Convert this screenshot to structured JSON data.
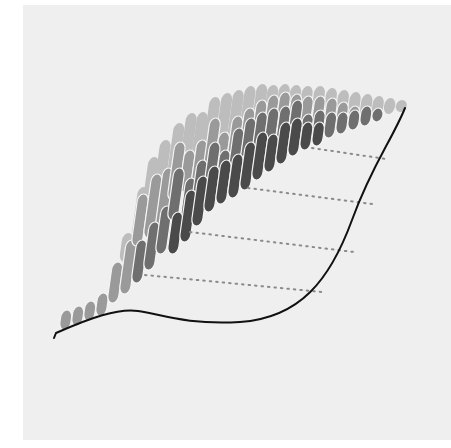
{
  "figure": {
    "background": "#efefef",
    "page_background": "#ffffff",
    "panel": {
      "x": 23,
      "y": 5,
      "w": 428,
      "h": 435
    },
    "outline_color": "#111111",
    "vein_color": "#8a8a8a",
    "layer_colors": [
      "#bdbdbd",
      "#9a9a9a",
      "#6f6f6f",
      "#4a4a4a"
    ],
    "separator_color": "#f4f4f4"
  },
  "leaf": {
    "outline_path": "M54,338 L56,333 C90,318 118,308 138,311 C160,314 185,325 240,322 C300,318 330,280 352,220 C372,165 392,140 405,108",
    "stem_tip": {
      "x": 54,
      "y": 338
    }
  },
  "veins": [
    {
      "x1": 312,
      "y1": 148,
      "x2": 386,
      "y2": 159
    },
    {
      "x1": 248,
      "y1": 188,
      "x2": 372,
      "y2": 204
    },
    {
      "x1": 190,
      "y1": 232,
      "x2": 354,
      "y2": 252
    },
    {
      "x1": 145,
      "y1": 275,
      "x2": 322,
      "y2": 292
    }
  ],
  "chart_data": {
    "type": "bar",
    "title": "",
    "xlabel": "",
    "ylabel": "",
    "legend": [],
    "layers": [
      "layer-1-light",
      "layer-2",
      "layer-3",
      "layer-4-dark"
    ],
    "columns": [
      {
        "x": 59,
        "w": 11,
        "segments": [
          {
            "l": 1,
            "top": 310,
            "bot": 330
          }
        ]
      },
      {
        "x": 71,
        "w": 11,
        "segments": [
          {
            "l": 1,
            "top": 306,
            "bot": 326
          }
        ]
      },
      {
        "x": 83,
        "w": 11,
        "segments": [
          {
            "l": 1,
            "top": 301,
            "bot": 321
          }
        ]
      },
      {
        "x": 95,
        "w": 11,
        "segments": [
          {
            "l": 1,
            "top": 293,
            "bot": 316
          }
        ]
      },
      {
        "x": 107,
        "w": 11,
        "segments": [
          {
            "l": 1,
            "top": 262,
            "bot": 303
          }
        ]
      },
      {
        "x": 119,
        "w": 11,
        "segments": [
          {
            "l": 0,
            "top": 233,
            "bot": 262
          },
          {
            "l": 1,
            "top": 240,
            "bot": 294
          }
        ]
      },
      {
        "x": 131,
        "w": 11,
        "segments": [
          {
            "l": 0,
            "top": 187,
            "bot": 240
          },
          {
            "l": 1,
            "top": 194,
            "bot": 246
          },
          {
            "l": 2,
            "top": 240,
            "bot": 283
          }
        ]
      },
      {
        "x": 143,
        "w": 11,
        "segments": [
          {
            "l": 0,
            "top": 157,
            "bot": 200
          },
          {
            "l": 1,
            "top": 174,
            "bot": 238
          },
          {
            "l": 2,
            "top": 222,
            "bot": 270
          }
        ]
      },
      {
        "x": 155,
        "w": 11,
        "segments": [
          {
            "l": 0,
            "top": 140,
            "bot": 180
          },
          {
            "l": 1,
            "top": 168,
            "bot": 228
          },
          {
            "l": 2,
            "top": 206,
            "bot": 254
          }
        ]
      },
      {
        "x": 167,
        "w": 11,
        "segments": [
          {
            "l": 0,
            "top": 123,
            "bot": 175
          },
          {
            "l": 1,
            "top": 142,
            "bot": 200
          },
          {
            "l": 2,
            "top": 168,
            "bot": 220
          },
          {
            "l": 3,
            "top": 212,
            "bot": 254
          }
        ]
      },
      {
        "x": 179,
        "w": 11,
        "segments": [
          {
            "l": 0,
            "top": 113,
            "bot": 168
          },
          {
            "l": 1,
            "top": 150,
            "bot": 192
          },
          {
            "l": 2,
            "top": 178,
            "bot": 228
          },
          {
            "l": 3,
            "top": 190,
            "bot": 242
          }
        ]
      },
      {
        "x": 191,
        "w": 11,
        "segments": [
          {
            "l": 0,
            "top": 112,
            "bot": 160
          },
          {
            "l": 1,
            "top": 140,
            "bot": 184
          },
          {
            "l": 2,
            "top": 160,
            "bot": 206
          },
          {
            "l": 3,
            "top": 176,
            "bot": 226
          }
        ]
      },
      {
        "x": 203,
        "w": 11,
        "segments": [
          {
            "l": 0,
            "top": 97,
            "bot": 148
          },
          {
            "l": 1,
            "top": 118,
            "bot": 170
          },
          {
            "l": 2,
            "top": 142,
            "bot": 192
          },
          {
            "l": 3,
            "top": 166,
            "bot": 212
          }
        ]
      },
      {
        "x": 215,
        "w": 11,
        "segments": [
          {
            "l": 0,
            "top": 93,
            "bot": 144
          },
          {
            "l": 1,
            "top": 132,
            "bot": 164
          },
          {
            "l": 2,
            "top": 150,
            "bot": 188
          },
          {
            "l": 3,
            "top": 160,
            "bot": 204
          }
        ]
      },
      {
        "x": 227,
        "w": 11,
        "segments": [
          {
            "l": 0,
            "top": 90,
            "bot": 138
          },
          {
            "l": 1,
            "top": 116,
            "bot": 158
          },
          {
            "l": 2,
            "top": 128,
            "bot": 178
          },
          {
            "l": 3,
            "top": 154,
            "bot": 198
          }
        ]
      },
      {
        "x": 239,
        "w": 11,
        "segments": [
          {
            "l": 0,
            "top": 86,
            "bot": 132
          },
          {
            "l": 1,
            "top": 108,
            "bot": 150
          },
          {
            "l": 2,
            "top": 118,
            "bot": 168
          },
          {
            "l": 3,
            "top": 142,
            "bot": 190
          }
        ]
      },
      {
        "x": 251,
        "w": 11,
        "segments": [
          {
            "l": 0,
            "top": 84,
            "bot": 128
          },
          {
            "l": 1,
            "top": 100,
            "bot": 142
          },
          {
            "l": 2,
            "top": 112,
            "bot": 158
          },
          {
            "l": 3,
            "top": 132,
            "bot": 180
          }
        ]
      },
      {
        "x": 263,
        "w": 11,
        "segments": [
          {
            "l": 0,
            "top": 85,
            "bot": 122
          },
          {
            "l": 1,
            "top": 95,
            "bot": 136
          },
          {
            "l": 2,
            "top": 108,
            "bot": 150
          },
          {
            "l": 3,
            "top": 134,
            "bot": 172
          }
        ]
      },
      {
        "x": 275,
        "w": 11,
        "segments": [
          {
            "l": 0,
            "top": 84,
            "bot": 118
          },
          {
            "l": 1,
            "top": 92,
            "bot": 130
          },
          {
            "l": 2,
            "top": 106,
            "bot": 146
          },
          {
            "l": 3,
            "top": 122,
            "bot": 164
          }
        ]
      },
      {
        "x": 287,
        "w": 11,
        "segments": [
          {
            "l": 0,
            "top": 85,
            "bot": 114
          },
          {
            "l": 1,
            "top": 94,
            "bot": 128
          },
          {
            "l": 2,
            "top": 100,
            "bot": 140
          },
          {
            "l": 3,
            "top": 118,
            "bot": 156
          }
        ]
      },
      {
        "x": 299,
        "w": 11,
        "segments": [
          {
            "l": 0,
            "top": 86,
            "bot": 112
          },
          {
            "l": 1,
            "top": 96,
            "bot": 126
          },
          {
            "l": 2,
            "top": 114,
            "bot": 144
          },
          {
            "l": 3,
            "top": 122,
            "bot": 150
          }
        ]
      },
      {
        "x": 311,
        "w": 11,
        "segments": [
          {
            "l": 0,
            "top": 86,
            "bot": 114
          },
          {
            "l": 1,
            "top": 96,
            "bot": 126
          },
          {
            "l": 2,
            "top": 110,
            "bot": 140
          },
          {
            "l": 3,
            "top": 122,
            "bot": 146
          }
        ]
      },
      {
        "x": 323,
        "w": 11,
        "segments": [
          {
            "l": 0,
            "top": 88,
            "bot": 116
          },
          {
            "l": 1,
            "top": 98,
            "bot": 128
          },
          {
            "l": 2,
            "top": 112,
            "bot": 138
          }
        ]
      },
      {
        "x": 335,
        "w": 11,
        "segments": [
          {
            "l": 0,
            "top": 90,
            "bot": 118
          },
          {
            "l": 1,
            "top": 102,
            "bot": 126
          },
          {
            "l": 2,
            "top": 112,
            "bot": 134
          }
        ]
      },
      {
        "x": 347,
        "w": 11,
        "segments": [
          {
            "l": 0,
            "top": 92,
            "bot": 118
          },
          {
            "l": 1,
            "top": 106,
            "bot": 126
          },
          {
            "l": 2,
            "top": 110,
            "bot": 130
          }
        ]
      },
      {
        "x": 359,
        "w": 11,
        "segments": [
          {
            "l": 0,
            "top": 94,
            "bot": 118
          },
          {
            "l": 2,
            "top": 106,
            "bot": 126
          }
        ]
      },
      {
        "x": 371,
        "w": 11,
        "segments": [
          {
            "l": 0,
            "top": 96,
            "bot": 116
          },
          {
            "l": 2,
            "top": 108,
            "bot": 122
          }
        ]
      },
      {
        "x": 383,
        "w": 11,
        "segments": [
          {
            "l": 0,
            "top": 98,
            "bot": 114
          }
        ]
      },
      {
        "x": 395,
        "w": 11,
        "segments": [
          {
            "l": 0,
            "top": 100,
            "bot": 112
          }
        ]
      }
    ]
  }
}
